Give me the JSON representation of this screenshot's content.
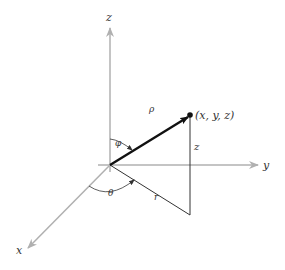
{
  "diagram": {
    "type": "spherical-coordinates",
    "axes": {
      "x": {
        "label": "x"
      },
      "y": {
        "label": "y"
      },
      "z": {
        "label": "z"
      }
    },
    "point": {
      "label": "(x, y, z)"
    },
    "segments": {
      "rho": {
        "label": "ρ"
      },
      "height": {
        "label": "z"
      },
      "radius": {
        "label": "r"
      }
    },
    "angles": {
      "phi": {
        "label": "φ"
      },
      "theta": {
        "label": "θ"
      }
    },
    "colors": {
      "axis": "#b0b0b0",
      "vector": "#111111",
      "segment": "#333333",
      "text": "#333333"
    }
  }
}
